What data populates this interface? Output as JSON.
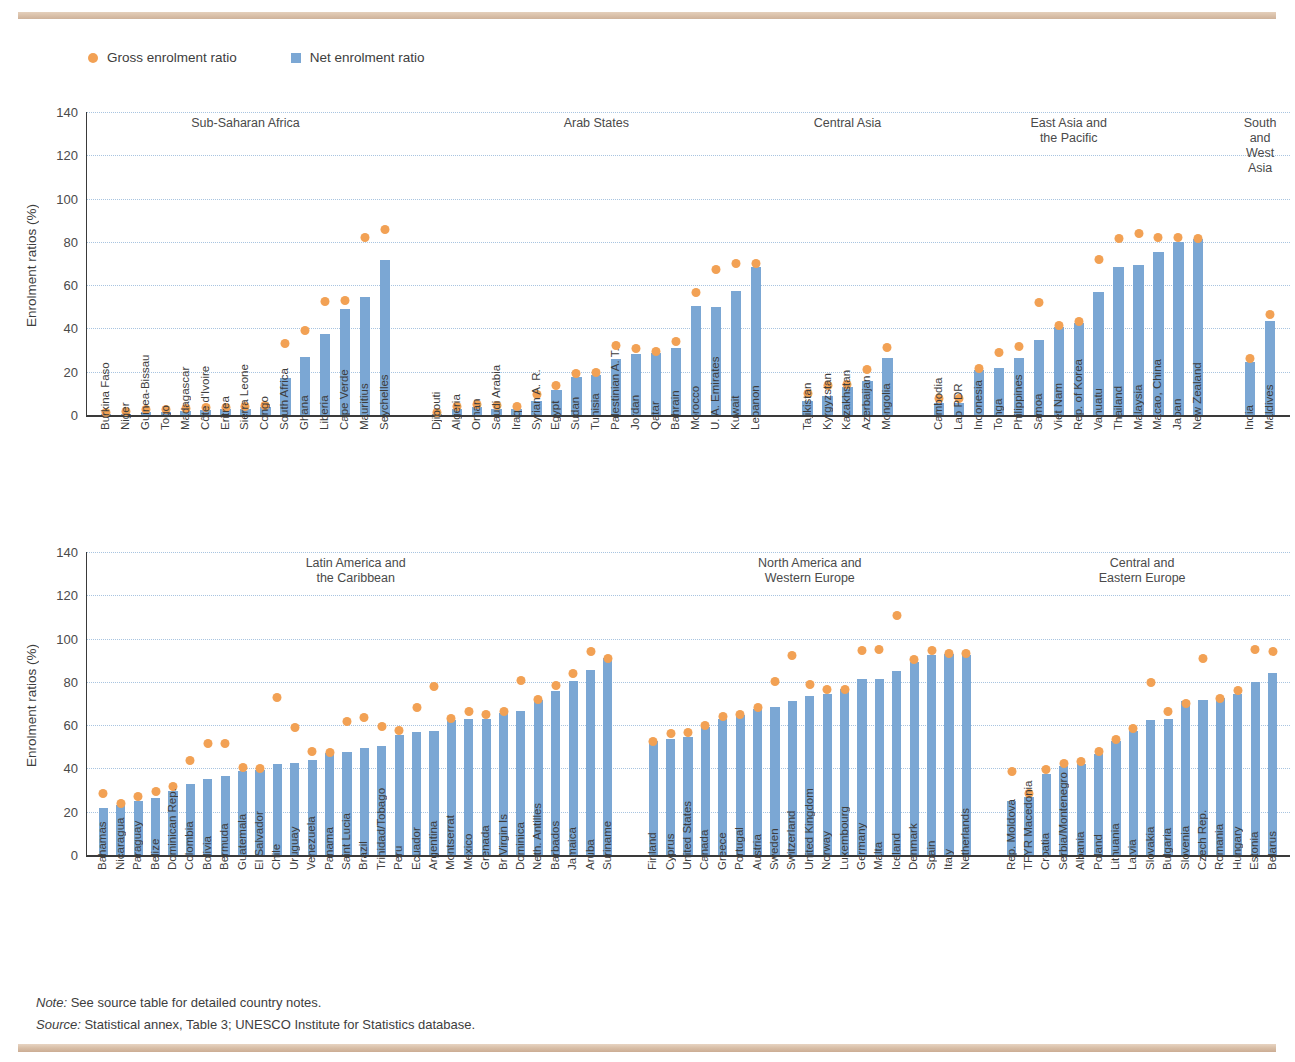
{
  "page": {
    "clipped_title": "",
    "note_label": "Note:",
    "note_text": " See source table for detailed country notes.",
    "source_label": "Source:",
    "source_text": " Statistical annex, Table 3; UNESCO Institute for Statistics database."
  },
  "legend": {
    "gross": "Gross enrolment ratio",
    "net": "Net enrolment ratio",
    "gross_color": "#f2a154",
    "net_color": "#7ba7d4"
  },
  "chart_data": [
    {
      "type": "bar",
      "id": "chart-top",
      "title": "",
      "xlabel": "",
      "ylabel": "Enrolment ratios (%)",
      "ylim": [
        0,
        140
      ],
      "yticks": [
        0,
        20,
        40,
        60,
        80,
        100,
        120,
        140
      ],
      "grid": true,
      "legend_position": "top-left",
      "series": [
        {
          "name": "Net enrolment ratio",
          "marker": "bar",
          "color": "#7ba7d4"
        },
        {
          "name": "Gross enrolment ratio",
          "marker": "dot",
          "color": "#f2a154"
        }
      ],
      "groups": [
        {
          "region": "Sub-Saharan Africa",
          "categories": [
            "Burkina Faso",
            "Niger",
            "Guinea-Bissau",
            "Togo",
            "Madagascar",
            "Côte d'Ivoire",
            "Eritrea",
            "Sierra Leone",
            "Congo",
            "South Africa",
            "Ghana",
            "Liberia",
            "Cape Verde",
            "Mauritius",
            "Seychelles"
          ],
          "net": [
            0.5,
            0.6,
            1.2,
            1.4,
            1.8,
            2.2,
            2.6,
            3.0,
            3.5,
            17.0,
            27.0,
            37.5,
            49.0,
            54.5,
            71.5
          ],
          "gross": [
            1.3,
            1.6,
            2.4,
            2.4,
            3.0,
            3.4,
            3.6,
            3.8,
            4.6,
            33.0,
            39.0,
            52.5,
            53.0,
            82.0,
            85.5
          ]
        },
        {
          "region": "Arab States",
          "categories": [
            "Djibouti",
            "Algeria",
            "Oman",
            "Saudi Arabia",
            "Iraq",
            "Syrian A. R.",
            "Egypt",
            "Sudan",
            "Tunisia",
            "Palestinian A. T.",
            "Jordan",
            "Qatar",
            "Bahrain",
            "Morocco",
            "U. A. Emirates",
            "Kuwait",
            "Lebanon"
          ],
          "net": [
            0.4,
            3.0,
            3.6,
            3.0,
            2.6,
            6.5,
            11.5,
            17.5,
            18.5,
            26.0,
            28.0,
            28.5,
            31.0,
            50.5,
            50.0,
            57.5,
            68.5
          ],
          "gross": [
            1.0,
            4.0,
            5.0,
            4.5,
            4.0,
            9.5,
            13.5,
            19.0,
            19.5,
            32.0,
            30.5,
            29.5,
            34.0,
            56.5,
            67.0,
            70.0,
            70.0
          ]
        },
        {
          "region": "Central Asia",
          "categories": [
            "Tajikistan",
            "Kyrgyzstan",
            "Kazakhstan",
            "Azerbaijan",
            "Mongolia"
          ],
          "net": [
            6.5,
            9.0,
            13.0,
            15.5,
            26.5
          ],
          "gross": [
            10.0,
            13.5,
            14.0,
            21.0,
            31.0
          ]
        },
        {
          "region": "East Asia and\nthe Pacific",
          "categories": [
            "Cambodia",
            "Lao PDR",
            "Indonesia",
            "Tonga",
            "Philippines",
            "Samoa",
            "Viet Nam",
            "Rep. of Korea",
            "Vanuatu",
            "Thailand",
            "Malaysia",
            "Macao, China",
            "Japan",
            "New Zealand"
          ],
          "net": [
            5.5,
            5.5,
            21.0,
            21.5,
            26.5,
            34.5,
            40.5,
            42.5,
            57.0,
            68.5,
            69.5,
            75.5,
            80.0,
            81.5
          ],
          "gross": [
            7.5,
            7.5,
            21.5,
            29.0,
            31.5,
            52.0,
            41.5,
            43.0,
            72.0,
            81.5,
            84.0,
            82.0,
            82.0,
            81.5
          ]
        },
        {
          "region": "South and\nWest Asia",
          "categories": [
            "India",
            "Maldives"
          ],
          "net": [
            24.5,
            43.5
          ],
          "gross": [
            26.0,
            46.5
          ]
        }
      ]
    },
    {
      "type": "bar",
      "id": "chart-bottom",
      "title": "",
      "xlabel": "",
      "ylabel": "Enrolment ratios (%)",
      "ylim": [
        0,
        140
      ],
      "yticks": [
        0,
        20,
        40,
        60,
        80,
        100,
        120,
        140
      ],
      "grid": true,
      "series": [
        {
          "name": "Net enrolment ratio",
          "marker": "bar",
          "color": "#7ba7d4"
        },
        {
          "name": "Gross enrolment ratio",
          "marker": "dot",
          "color": "#f2a154"
        }
      ],
      "groups": [
        {
          "region": "Latin America and\nthe Caribbean",
          "categories": [
            "Bahamas",
            "Nicaragua",
            "Paraguay",
            "Belize",
            "Dominican Rep.",
            "Colombia",
            "Bolivia",
            "Bermuda",
            "Guatemala",
            "El Salvador",
            "Chile",
            "Uruguay",
            "Venezuela",
            "Panama",
            "Saint Lucia",
            "Brazil",
            "Trinidad/Tobago",
            "Peru",
            "Ecuador",
            "Argentina",
            "Montserrat",
            "Mexico",
            "Grenada",
            "Br Virgin Is",
            "Dominica",
            "Neth. Antilles",
            "Barbados",
            "Jamaica",
            "Aruba",
            "Suriname"
          ],
          "net": [
            21.5,
            23.0,
            25.0,
            26.5,
            29.5,
            33.0,
            35.0,
            36.5,
            39.0,
            39.5,
            42.0,
            42.5,
            44.0,
            47.0,
            47.5,
            49.5,
            50.5,
            55.5,
            57.0,
            57.5,
            62.5,
            63.0,
            63.0,
            65.5,
            66.5,
            71.5,
            76.0,
            80.5,
            85.5,
            91.0
          ],
          "gross": [
            28.5,
            24.0,
            27.0,
            29.5,
            31.5,
            43.5,
            51.5,
            51.5,
            40.5,
            40.0,
            73.0,
            59.0,
            48.0,
            47.5,
            61.5,
            63.5,
            59.5,
            57.5,
            68.0,
            78.0,
            63.0,
            66.5,
            65.0,
            66.5,
            80.5,
            72.0,
            78.5,
            84.0,
            94.0,
            91.0
          ]
        },
        {
          "region": "North America and\nWestern Europe",
          "categories": [
            "Finland",
            "Cyprus",
            "United States",
            "Canada",
            "Greece",
            "Portugal",
            "Austria",
            "Sweden",
            "Switzerland",
            "United Kingdom",
            "Norway",
            "Luxembourg",
            "Germany",
            "Malta",
            "Iceland",
            "Denmark",
            "Spain",
            "Italy",
            "Netherlands"
          ],
          "net": [
            52.5,
            53.5,
            54.5,
            59.0,
            63.0,
            64.5,
            67.5,
            68.5,
            71.0,
            73.5,
            74.5,
            76.5,
            81.5,
            81.5,
            85.0,
            89.0,
            92.5,
            93.0,
            92.5
          ],
          "gross": [
            52.5,
            56.0,
            56.5,
            60.0,
            64.0,
            65.0,
            68.0,
            80.0,
            92.0,
            79.0,
            76.5,
            76.5,
            94.5,
            95.0,
            110.5,
            90.5,
            94.5,
            93.0,
            93.0
          ]
        },
        {
          "region": "Central and\nEastern Europe",
          "categories": [
            "Rep. Moldova",
            "TFYR Macedonia",
            "Croatia",
            "Serbia/Montenegro",
            "Albania",
            "Poland",
            "Lithuania",
            "Latvia",
            "Slovakia",
            "Bulgaria",
            "Slovenia",
            "Czech Rep.",
            "Romania",
            "Hungary",
            "Estonia",
            "Belarus"
          ],
          "net": [
            25.0,
            27.0,
            37.5,
            41.0,
            42.0,
            46.5,
            52.5,
            57.5,
            62.5,
            63.0,
            71.0,
            71.5,
            72.5,
            74.5,
            80.0,
            84.0
          ],
          "gross": [
            38.5,
            28.5,
            39.5,
            42.5,
            43.0,
            48.0,
            53.5,
            58.5,
            79.5,
            66.5,
            70.0,
            91.0,
            72.5,
            76.0,
            95.0,
            94.0
          ]
        }
      ]
    }
  ]
}
